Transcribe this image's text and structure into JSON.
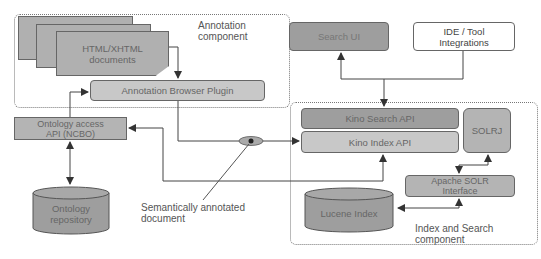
{
  "diagram": {
    "annotation_group": {
      "label_line1": "Annotation",
      "label_line2": "component",
      "documents": {
        "line1": "HTML/XHTML",
        "line2": "documents"
      },
      "plugin": "Annotation Browser Plugin"
    },
    "ontology_api": {
      "line1": "Ontology access",
      "line2": "API (NCBO)"
    },
    "ontology_repo": {
      "line1": "Ontology",
      "line2": "repository"
    },
    "semantic_doc_label": {
      "line1": "Semantically annotated",
      "line2": "document"
    },
    "search_ui": "Search UI",
    "ide_tools": {
      "line1": "IDE / Tool",
      "line2": "Integrations"
    },
    "index_group": {
      "label_line1": "Index and Search",
      "label_line2": "component",
      "kino_search_api": "Kino Search API",
      "kino_index_api": "Kino Index API",
      "solrj": "SOLRJ",
      "apache_solr": {
        "line1": "Apache SOLR",
        "line2": "Interface"
      },
      "lucene_index": "Lucene Index"
    },
    "colors": {
      "dark_fill": "#9e9e9e",
      "mid_fill": "#b4b4b4",
      "light_fill": "#c8c8c8",
      "stroke": "#555555"
    }
  }
}
